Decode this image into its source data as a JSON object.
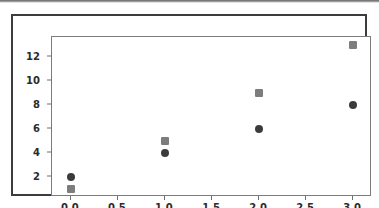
{
  "figure": {
    "background_color": "#ffffff",
    "frame_color": "#3c3c3c",
    "axes_border_color": "#7c7c7c",
    "top_band_color": "#6e6e6e"
  },
  "axis_labels": {
    "y_ticks": [
      "2",
      "4",
      "6",
      "8",
      "10",
      "12"
    ],
    "x_ticks": [
      "0.0",
      "0.5",
      "1.0",
      "1.5",
      "2.0",
      "2.5",
      "3.0"
    ]
  },
  "chart_data": {
    "type": "scatter",
    "title": "",
    "xlabel": "",
    "ylabel": "",
    "xlim": [
      -0.2,
      3.2
    ],
    "ylim": [
      0.3,
      13.7
    ],
    "x": [
      0,
      1,
      2,
      3
    ],
    "grid": false,
    "legend": "none",
    "xticks": [
      0.0,
      0.5,
      1.0,
      1.5,
      2.0,
      2.5,
      3.0
    ],
    "yticks": [
      2,
      4,
      6,
      8,
      10,
      12
    ],
    "series": [
      {
        "name": "circles",
        "marker": "o",
        "color": "#3b3b3b",
        "values": [
          2,
          4,
          6,
          8
        ]
      },
      {
        "name": "squares",
        "marker": "s",
        "color": "#7d7d7d",
        "values": [
          1,
          5,
          9,
          13
        ]
      }
    ]
  }
}
